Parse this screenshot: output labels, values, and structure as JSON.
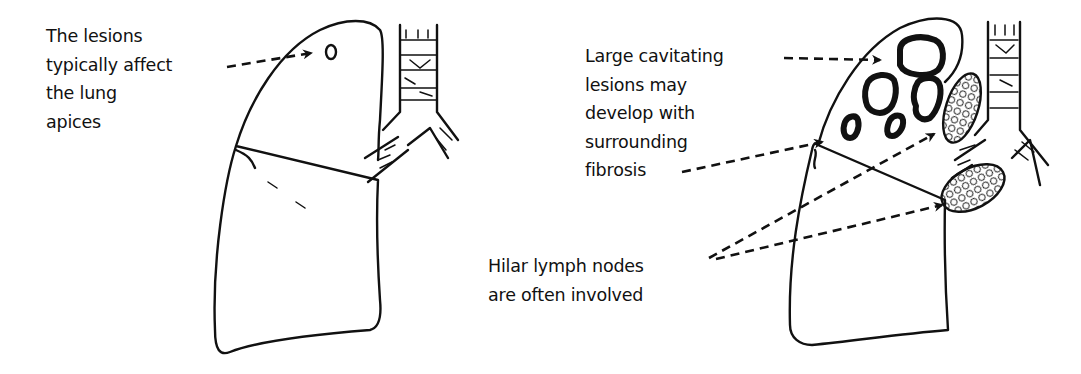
{
  "figure": {
    "left_panel": {
      "annotation": {
        "lines": [
          "The lesions",
          "typically affect",
          "the lung",
          "apices"
        ]
      },
      "structures": [
        "lung-outline",
        "apical-lesion",
        "trachea",
        "bronchus",
        "fissure"
      ]
    },
    "right_panel": {
      "annotations": [
        {
          "lines": [
            "Large cavitating",
            "lesions may",
            "develop with",
            "surrounding",
            "fibrosis"
          ]
        },
        {
          "lines": [
            "Hilar lymph nodes",
            "are often involved"
          ]
        }
      ],
      "structures": [
        "lung-outline",
        "cavitating-lesions",
        "hilar-lymph-nodes",
        "trachea",
        "bronchus"
      ]
    },
    "colors": {
      "ink": "#111111",
      "background": "#ffffff"
    }
  }
}
